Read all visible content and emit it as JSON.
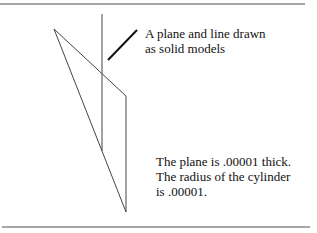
{
  "figure": {
    "colors": {
      "background": "#ffffff",
      "rule": "#888888",
      "line": "#444444",
      "pointer": "#111111",
      "text": "#111111"
    },
    "labels": {
      "model_note": {
        "lines": [
          "A plane and line drawn",
          "as solid models"
        ]
      },
      "dimension_note": {
        "lines": [
          "The plane is .00001 thick.",
          "The radius of the cylinder",
          "is .00001."
        ]
      }
    },
    "geometry": {
      "top_rule": {
        "x1": 0,
        "y1": 4,
        "x2": 305,
        "y2": 4
      },
      "bottom_rule": {
        "x1": 2,
        "y1": 227,
        "x2": 310,
        "y2": 227
      },
      "line_cylinder": {
        "x1": 102,
        "y1": 14,
        "x2": 102,
        "y2": 151
      },
      "plane_outline": [
        [
          54,
          29
        ],
        [
          126,
          96
        ],
        [
          126,
          212
        ],
        [
          54,
          29
        ]
      ],
      "pointer": {
        "x1": 108,
        "y1": 60,
        "x2": 137,
        "y2": 30
      }
    }
  }
}
